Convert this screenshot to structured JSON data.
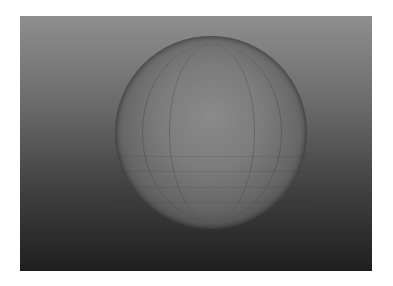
{
  "image": {
    "description": "3D rendered shaded sphere on a vertical gray gradient background",
    "subject": "sphere",
    "background_gradient": {
      "top": "#8e8e8e",
      "bottom": "#1f1f1f"
    },
    "sphere_colors": {
      "center": "#8a8a8a",
      "edge": "#1e1e1e"
    },
    "border_color": "#ffffff"
  }
}
